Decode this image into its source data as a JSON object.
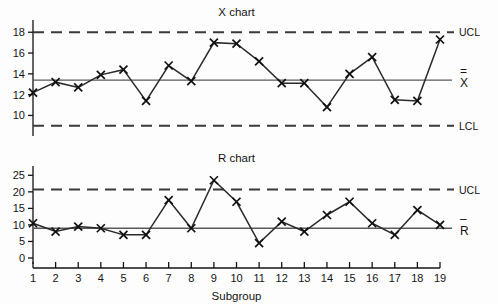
{
  "figure": {
    "background_color": "#fdfdfd",
    "ink_color": "#141414",
    "line_color": "#2b2b2b",
    "center_line_color": "#5a5a5a",
    "limit_line_color": "#3a3a3a"
  },
  "xaxis": {
    "title": "Subgroup",
    "ticks": [
      "1",
      "2",
      "3",
      "4",
      "5",
      "6",
      "7",
      "8",
      "9",
      "10",
      "11",
      "12",
      "13",
      "14",
      "15",
      "16",
      "17",
      "18",
      "19"
    ]
  },
  "xbar_chart": {
    "title": "X chart",
    "ytick_labels": [
      "10",
      "12",
      "14",
      "16",
      "18"
    ],
    "ucl_label": "UCL",
    "lcl_label": "LCL",
    "center_label": "X",
    "center_overbar": "=",
    "marker_glyph": "×"
  },
  "r_chart": {
    "title": "R chart",
    "ytick_labels": [
      "0",
      "5",
      "10",
      "15",
      "20",
      "25"
    ],
    "ucl_label": "UCL",
    "center_label": "R",
    "center_overbar": "–",
    "marker_glyph": "×"
  },
  "chart_data": [
    {
      "type": "line",
      "id": "xbar-chart",
      "title": "X chart",
      "xlabel": "Subgroup",
      "ylabel": "",
      "categories": [
        1,
        2,
        3,
        4,
        5,
        6,
        7,
        8,
        9,
        10,
        11,
        12,
        13,
        14,
        15,
        16,
        17,
        18,
        19
      ],
      "values": [
        12.2,
        13.2,
        12.7,
        13.9,
        14.4,
        11.4,
        14.8,
        13.3,
        17.0,
        16.9,
        15.2,
        13.1,
        13.1,
        10.8,
        14.0,
        15.6,
        11.5,
        11.4,
        17.3
      ],
      "xlim": [
        1,
        19
      ],
      "ylim": [
        8.6,
        18.6
      ],
      "yticks": [
        10,
        12,
        14,
        16,
        18
      ],
      "grid": false,
      "legend": "none",
      "marker": "x",
      "annotations": [
        {
          "name": "UCL",
          "label": "UCL",
          "value": 18.0,
          "style": "dashed"
        },
        {
          "name": "center",
          "label": "X-double-bar",
          "value": 13.4,
          "style": "solid"
        },
        {
          "name": "LCL",
          "label": "LCL",
          "value": 9.0,
          "style": "dashed"
        }
      ]
    },
    {
      "type": "line",
      "id": "r-chart",
      "title": "R chart",
      "xlabel": "Subgroup",
      "ylabel": "",
      "categories": [
        1,
        2,
        3,
        4,
        5,
        6,
        7,
        8,
        9,
        10,
        11,
        12,
        13,
        14,
        15,
        16,
        17,
        18,
        19
      ],
      "values": [
        10.5,
        8.0,
        9.5,
        9.0,
        7.0,
        7.0,
        17.5,
        9.0,
        23.5,
        17.0,
        4.5,
        11.0,
        8.0,
        13.0,
        17.0,
        10.5,
        7.0,
        14.5,
        10.0
      ],
      "xlim": [
        1,
        19
      ],
      "ylim": [
        0,
        26
      ],
      "yticks": [
        0,
        5,
        10,
        15,
        20,
        25
      ],
      "grid": false,
      "legend": "none",
      "marker": "x",
      "annotations": [
        {
          "name": "UCL",
          "label": "UCL",
          "value": 20.7,
          "style": "dashed"
        },
        {
          "name": "center",
          "label": "R-bar",
          "value": 9.0,
          "style": "solid"
        }
      ]
    }
  ]
}
